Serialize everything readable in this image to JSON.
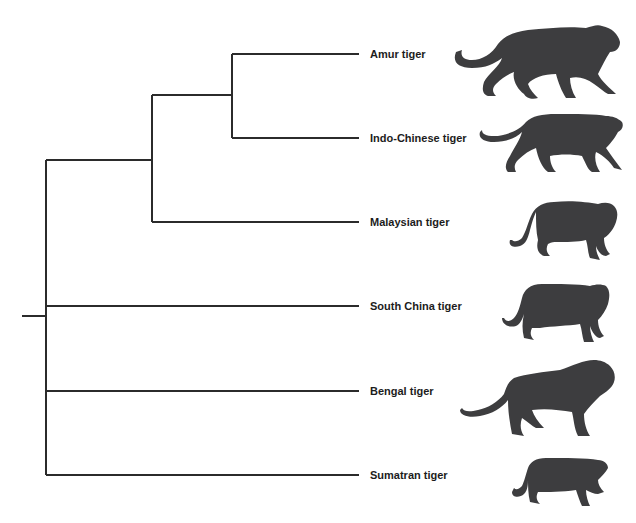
{
  "diagram": {
    "type": "phylogenetic-tree",
    "line_color": "#2b2b2b",
    "silhouette_color": "#3d3d3f",
    "leaves": [
      {
        "id": "amur",
        "label": "Amur tiger",
        "y": 54
      },
      {
        "id": "indo-chinese",
        "label": "Indo-Chinese tiger",
        "y": 138
      },
      {
        "id": "malaysian",
        "label": "Malaysian tiger",
        "y": 222
      },
      {
        "id": "south-china",
        "label": "South China tiger",
        "y": 306
      },
      {
        "id": "bengal",
        "label": "Bengal tiger",
        "y": 391
      },
      {
        "id": "sumatran",
        "label": "Sumatran tiger",
        "y": 475
      }
    ],
    "clades": [
      {
        "id": "amur-indochinese",
        "members": [
          "Amur tiger",
          "Indo-Chinese tiger"
        ]
      },
      {
        "id": "amur-indochinese-malaysian",
        "members": [
          "Amur tiger",
          "Indo-Chinese tiger",
          "Malaysian tiger"
        ]
      },
      {
        "id": "root",
        "members": [
          "Amur tiger",
          "Indo-Chinese tiger",
          "Malaysian tiger",
          "South China tiger",
          "Bengal tiger",
          "Sumatran tiger"
        ]
      }
    ],
    "newick": "(((Amur tiger,Indo-Chinese tiger),Malaysian tiger),South China tiger,Bengal tiger,Sumatran tiger);"
  }
}
